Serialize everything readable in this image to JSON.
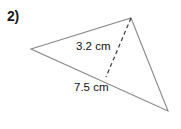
{
  "figure": {
    "problem_number": "2)",
    "height_label": "3.2 cm",
    "base_label": "7.5 cm",
    "stroke_color": "#8a8a8a",
    "text_color": "#111111",
    "background_color": "#ffffff"
  },
  "geometry": {
    "vertices": {
      "left": [
        31,
        49
      ],
      "top": [
        131,
        18
      ],
      "bottom_right": [
        168,
        111
      ]
    },
    "altitude": {
      "from": [
        131,
        18
      ],
      "to": [
        106,
        77
      ],
      "style": "dashed"
    }
  }
}
